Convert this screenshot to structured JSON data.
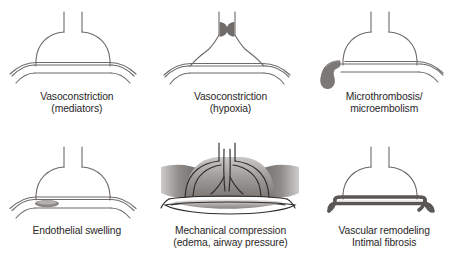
{
  "figure": {
    "layout": {
      "columns": 3,
      "rows": 2
    },
    "colors": {
      "outline": "#6e6a68",
      "outline_dark": "#3a3735",
      "fill_blob": "#6f6c6a",
      "fill_thrombus": "#7b7876",
      "fill_swelling": "#8a8785",
      "edema_light": "#d8d6d4",
      "edema_mid": "#a9a6a4",
      "edema_dark": "#767371",
      "vessel_wall": "#5a5755",
      "text": "#2a2728",
      "background": "#ffffff"
    },
    "panels": [
      {
        "id": "vasoconstriction-mediators",
        "position": "top-left",
        "caption_line1": "Vasoconstriction",
        "caption_line2": "(mediators)",
        "caption": "Vasoconstriction\n(mediators)",
        "feature": "narrowed-vessel-lumen"
      },
      {
        "id": "vasoconstriction-hypoxia",
        "position": "top-center",
        "caption_line1": "Vasoconstriction",
        "caption_line2": "(hypoxia)",
        "caption": "Vasoconstriction\n(hypoxia)",
        "feature": "paired-constricting-blobs"
      },
      {
        "id": "microthrombosis-microembolism",
        "position": "top-right",
        "caption_line1": "Microthrombosis/",
        "caption_line2": "microembolism",
        "caption": "Microthrombosis/\nmicroembolism",
        "feature": "hooked-thrombus-left"
      },
      {
        "id": "endothelial-swelling",
        "position": "bottom-left",
        "caption_line1": "Endothelial swelling",
        "caption_line2": "",
        "caption": "Endothelial swelling",
        "feature": "lens-shaped-endothelial-bulge"
      },
      {
        "id": "mechanical-compression",
        "position": "bottom-center",
        "caption_line1": "Mechanical compression",
        "caption_line2": "(edema, airway pressure)",
        "caption": "Mechanical compression\n(edema, airway pressure)",
        "feature": "distended-alveolus-with-edema"
      },
      {
        "id": "vascular-remodeling",
        "position": "bottom-right",
        "caption_line1": "Vascular remodeling",
        "caption_line2": "Intimal fibrosis",
        "caption": "Vascular remodeling\nIntimal fibrosis",
        "feature": "thickened-vessel-walls"
      }
    ]
  }
}
